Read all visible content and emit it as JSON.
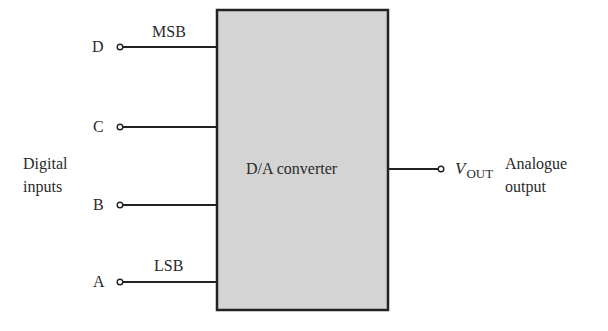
{
  "diagram": {
    "block": {
      "label": "D/A converter",
      "fill": "#d4d4d4",
      "stroke": "#222222"
    },
    "inputs_group_label": [
      "Digital",
      "inputs"
    ],
    "inputs": [
      {
        "name": "D",
        "annotation": "MSB"
      },
      {
        "name": "C",
        "annotation": ""
      },
      {
        "name": "B",
        "annotation": ""
      },
      {
        "name": "A",
        "annotation": "LSB"
      }
    ],
    "output": {
      "symbol": "V",
      "subscript": "OUT",
      "label": [
        "Analogue",
        "output"
      ]
    }
  }
}
